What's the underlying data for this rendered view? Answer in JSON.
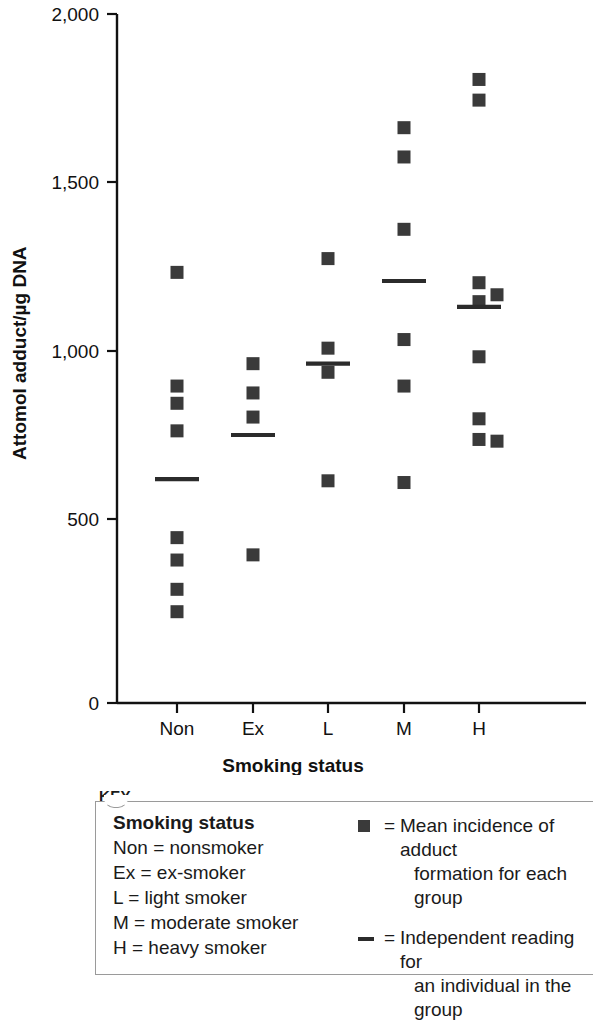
{
  "chart_data": {
    "type": "scatter",
    "title": "",
    "xlabel": "Smoking status",
    "ylabel": "Attomol adduct/µg DNA",
    "ylim": [
      0,
      2000
    ],
    "yticks": [
      0,
      500,
      1000,
      1500,
      2000
    ],
    "ytick_labels": [
      "0",
      "500",
      "1,000",
      "1,500",
      "2,000"
    ],
    "categories": [
      "Non",
      "Ex",
      "L",
      "M",
      "H"
    ],
    "grid": false,
    "legend_position": "below-plot",
    "series": [
      {
        "name": "Independent reading for an individual in the group",
        "marker": "square",
        "color": "#3a3a3a",
        "groups": [
          {
            "category": "Non",
            "values": [
              1250,
              920,
              870,
              790,
              480,
              415,
              330,
              265
            ]
          },
          {
            "category": "Ex",
            "values": [
              985,
              900,
              830,
              430
            ]
          },
          {
            "category": "L",
            "values": [
              1290,
              1030,
              960,
              645
            ]
          },
          {
            "category": "M",
            "values": [
              1670,
              1585,
              1375,
              1055,
              920,
              640
            ]
          },
          {
            "category": "H",
            "values": [
              1810,
              1750,
              1220,
              1185,
              1165,
              1005,
              825,
              765,
              760
            ]
          }
        ]
      },
      {
        "name": "Mean incidence of adduct formation for each group",
        "marker": "horizontal-line",
        "color": "#2b2b2b",
        "groups": [
          {
            "category": "Non",
            "mean": 650
          },
          {
            "category": "Ex",
            "mean": 778
          },
          {
            "category": "L",
            "mean": 985
          },
          {
            "category": "M",
            "mean": 1225
          },
          {
            "category": "H",
            "mean": 1150
          }
        ]
      }
    ]
  },
  "axes": {
    "y_title": "Attomol adduct/µg DNA",
    "x_title": "Smoking status",
    "y_tick_labels": [
      "2,000",
      "1,500",
      "1,000",
      "500",
      "0"
    ],
    "x_tick_labels": [
      "Non",
      "Ex",
      "L",
      "M",
      "H"
    ]
  },
  "key": {
    "heading": "KEY",
    "left": {
      "title": "Smoking status",
      "rows": [
        "Non = nonsmoker",
        "Ex = ex-smoker",
        "L = light smoker",
        "M = moderate smoker",
        "H = heavy smoker"
      ]
    },
    "right": {
      "items": [
        {
          "glyph": "square",
          "equals": "=",
          "line1": "Mean incidence of adduct",
          "line2": "formation for each group"
        },
        {
          "glyph": "dash",
          "equals": "=",
          "line1": "Independent reading for",
          "line2": "an individual in the group"
        }
      ]
    }
  },
  "colors": {
    "marker": "#3a3a3a",
    "mean_line": "#2b2b2b",
    "axis": "#111111",
    "key_border": "#9a9a9a",
    "background": "#ffffff"
  }
}
